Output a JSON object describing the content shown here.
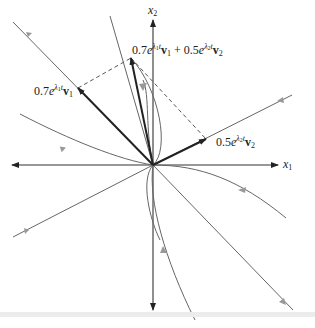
{
  "diagram": {
    "type": "phase-portrait",
    "axes": {
      "x_label": "x1",
      "y_label": "x2"
    },
    "labels": {
      "v1_term": {
        "coef": "0.7",
        "eigen": "λ1",
        "vec": "v1"
      },
      "v2_term": {
        "coef": "0.5",
        "eigen": "λ2",
        "vec": "v2"
      },
      "sum_term": {
        "coef1": "0.7",
        "eigen1": "λ1",
        "vec1": "v1",
        "plus": "+",
        "coef2": "0.5",
        "eigen2": "λ2",
        "vec2": "v2"
      }
    },
    "text": {
      "x1": "x",
      "x1_sub": "1",
      "x2": "x",
      "x2_sub": "2",
      "c07": "0.7",
      "c05": "0.5",
      "e": "e",
      "lam": "λ",
      "one": "1",
      "two": "2",
      "t": "t",
      "v": "v",
      "plus": "+"
    },
    "colors": {
      "axis": "#222222",
      "trajectory": "#666666",
      "vector": "#222222",
      "dashed": "#555555",
      "arrowhead_gray": "#999999"
    }
  }
}
